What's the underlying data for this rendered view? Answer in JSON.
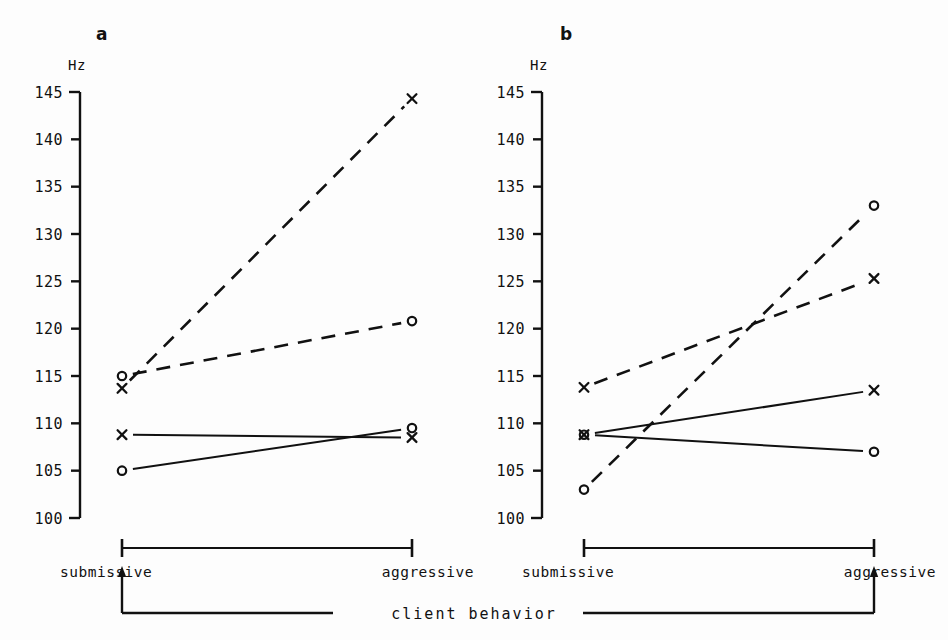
{
  "figure": {
    "axis_label_unit": "Hz",
    "x_left_label": "submissive",
    "x_right_label": "aggressive",
    "shared_axis_caption": "client behavior",
    "ink_color": "#111111",
    "background_color": "#fdfdfd"
  },
  "panels": [
    {
      "letter": "a"
    },
    {
      "letter": "b"
    }
  ],
  "chart_data": [
    {
      "type": "line",
      "title": "a",
      "xlabel": "client behavior",
      "ylabel": "Hz",
      "categories": [
        "submissive",
        "aggressive"
      ],
      "ylim": [
        100,
        145
      ],
      "yticks": [
        100,
        105,
        110,
        115,
        120,
        125,
        130,
        135,
        140,
        145
      ],
      "ytick_labels": [
        "100",
        "105",
        "110",
        "115",
        "120",
        "125",
        "130",
        "135",
        "140",
        "145"
      ],
      "grid": false,
      "legend": "none",
      "series": [
        {
          "name": "dashed-x",
          "marker": "x",
          "linestyle": "dashed",
          "values": [
            113.7,
            144.3
          ]
        },
        {
          "name": "dashed-circle",
          "marker": "o",
          "linestyle": "dashed",
          "values": [
            115.0,
            120.8
          ]
        },
        {
          "name": "solid-x",
          "marker": "x",
          "linestyle": "solid",
          "values": [
            108.8,
            108.5
          ]
        },
        {
          "name": "solid-circle",
          "marker": "o",
          "linestyle": "solid",
          "values": [
            105.0,
            109.5
          ]
        }
      ]
    },
    {
      "type": "line",
      "title": "b",
      "xlabel": "client behavior",
      "ylabel": "Hz",
      "categories": [
        "submissive",
        "aggressive"
      ],
      "ylim": [
        100,
        145
      ],
      "yticks": [
        100,
        105,
        110,
        115,
        120,
        125,
        130,
        135,
        140,
        145
      ],
      "ytick_labels": [
        "100",
        "105",
        "110",
        "115",
        "120",
        "125",
        "130",
        "135",
        "140",
        "145"
      ],
      "grid": false,
      "legend": "none",
      "series": [
        {
          "name": "dashed-x",
          "marker": "x",
          "linestyle": "dashed",
          "values": [
            113.8,
            125.3
          ]
        },
        {
          "name": "dashed-circle",
          "marker": "o",
          "linestyle": "dashed",
          "values": [
            103.0,
            133.0
          ]
        },
        {
          "name": "solid-x",
          "marker": "x",
          "linestyle": "solid",
          "values": [
            108.8,
            113.5
          ]
        },
        {
          "name": "solid-circle",
          "marker": "o",
          "linestyle": "solid",
          "values": [
            108.8,
            107.0
          ]
        }
      ]
    }
  ]
}
